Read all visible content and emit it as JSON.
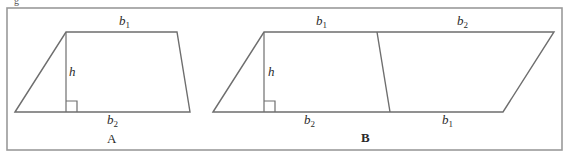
{
  "figure": {
    "prefix_fragment": "g",
    "frame": {
      "x": 7,
      "y": 8,
      "width": 555,
      "height": 142
    },
    "shapes": [
      {
        "id": "A",
        "type": "trapezoid",
        "caption": "A",
        "vertices": [
          [
            15,
            112
          ],
          [
            66,
            32
          ],
          [
            177,
            32
          ],
          [
            190,
            112
          ]
        ],
        "height_line": [
          [
            66,
            32
          ],
          [
            66,
            112
          ]
        ],
        "right_angle_box": {
          "x": 66,
          "y": 101,
          "size": 11
        },
        "labels": {
          "top": {
            "var": "b",
            "sub": "1"
          },
          "bottom": {
            "var": "b",
            "sub": "2"
          },
          "height": "h"
        }
      },
      {
        "id": "B",
        "type": "parallelogram",
        "caption": "B",
        "vertices": [
          [
            213,
            112
          ],
          [
            264,
            32
          ],
          [
            554,
            32
          ],
          [
            503,
            112
          ]
        ],
        "divider_line": [
          [
            377,
            32
          ],
          [
            390,
            112
          ]
        ],
        "height_line": [
          [
            264,
            32
          ],
          [
            264,
            112
          ]
        ],
        "right_angle_box": {
          "x": 264,
          "y": 101,
          "size": 11
        },
        "labels": {
          "top_left": {
            "var": "b",
            "sub": "1"
          },
          "top_right": {
            "var": "b",
            "sub": "2"
          },
          "bottom_left": {
            "var": "b",
            "sub": "2"
          },
          "bottom_right": {
            "var": "b",
            "sub": "1"
          },
          "height": "h"
        }
      }
    ]
  },
  "colors": {
    "frame": "#9a9a9a",
    "lines": "#6e6e6e",
    "text": "#2a2a2a",
    "background": "#ffffff"
  }
}
